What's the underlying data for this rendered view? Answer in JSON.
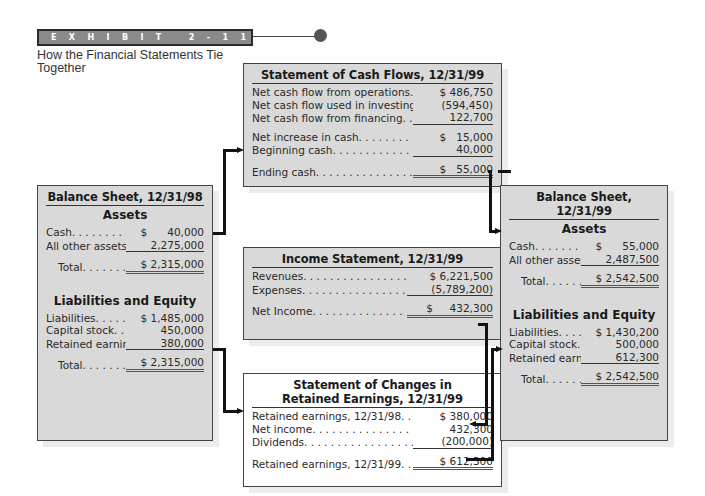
{
  "exhibit": {
    "label": "EXHIBIT 2-11",
    "subtitle": "How the Financial Statements Tie Together"
  },
  "cash_flows": {
    "title": "Statement of Cash Flows, 12/31/99",
    "rows": [
      {
        "label": "Net cash flow from operations. . .",
        "value": "$ 486,750"
      },
      {
        "label": "Net cash flow used in investing. .",
        "value": "(594,450)"
      },
      {
        "label": "Net cash flow from financing. . . .",
        "value": "122,700"
      },
      {
        "label": "Net increase in cash. . . . . . . . . .",
        "value": "$   15,000"
      },
      {
        "label": "Beginning cash. . . . . . . . . . . . .",
        "value": "40,000"
      },
      {
        "label": "Ending cash. . . . . . . . . . . . . . .",
        "value": "$   55,000"
      }
    ]
  },
  "balance_sheet_98": {
    "title": "Balance Sheet, 12/31/98",
    "assets_heading": "Assets",
    "assets": [
      {
        "label": "Cash. . . . . . . . .",
        "value": "$      40,000"
      },
      {
        "label": "All other assets. .",
        "value": "2,275,000"
      }
    ],
    "assets_total": {
      "label": "Total. . . . . . . .",
      "value": "$ 2,315,000"
    },
    "le_heading": "Liabilities and Equity",
    "liabilities_equity": [
      {
        "label": "Liabilities. . . . . .",
        "value": "$ 1,485,000"
      },
      {
        "label": "Capital stock. . .",
        "value": "450,000"
      },
      {
        "label": "Retained earnings",
        "value": "380,000"
      }
    ],
    "le_total": {
      "label": "Total. . . . . . . .",
      "value": "$ 2,315,000"
    }
  },
  "income_statement": {
    "title": "Income Statement, 12/31/99",
    "rows": [
      {
        "label": "Revenues. . . . . . . . . . . . . . . . .",
        "value": "$ 6,221,500"
      },
      {
        "label": "Expenses. . . . . . . . . . . . . . . . .",
        "value": "(5,789,200)"
      },
      {
        "label": "Net Income. . . . . . . . . . . . . .",
        "value": "$     432,300"
      }
    ]
  },
  "retained_earnings": {
    "title_line1": "Statement of Changes in",
    "title_line2": "Retained Earnings, 12/31/99",
    "rows": [
      {
        "label": "Retained earnings, 12/31/98. . .",
        "value": "$ 380,000"
      },
      {
        "label": "Net income. . . . . . . . . . . . . . . .",
        "value": "432,300"
      },
      {
        "label": "Dividends. . . . . . . . . . . . . . . . .",
        "value": "(200,000)"
      },
      {
        "label": "Retained earnings, 12/31/99. . .",
        "value": "$ 612,300"
      }
    ]
  },
  "balance_sheet_99": {
    "title": "Balance Sheet, 12/31/99",
    "assets_heading": "Assets",
    "assets": [
      {
        "label": "Cash. . . . . . . . .",
        "value": "$      55,000"
      },
      {
        "label": "All other assets. .",
        "value": "2,487,500"
      }
    ],
    "assets_total": {
      "label": "Total. . . . . . . .",
      "value": "$ 2,542,500"
    },
    "le_heading": "Liabilities and Equity",
    "liabilities_equity": [
      {
        "label": "Liabilities. . . . . .",
        "value": "$ 1,430,200"
      },
      {
        "label": "Capital stock. . .",
        "value": "500,000"
      },
      {
        "label": "Retained earnings",
        "value": "612,300"
      }
    ],
    "le_total": {
      "label": "Total. . . . . . . .",
      "value": "$ 2,542,500"
    }
  },
  "colors": {
    "box_fill": "#d9d9d9",
    "banner_fill": "#8a8a8a",
    "connector": "#111111"
  }
}
